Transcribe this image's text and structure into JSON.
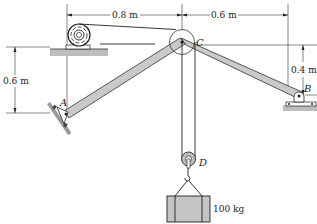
{
  "diagram": {
    "dimensions": {
      "top_left": "0.8 m",
      "top_right": "0.6 m",
      "left_vertical": "0.6 m",
      "right_vertical": "0.4 m"
    },
    "points": {
      "A": "A",
      "B": "B",
      "C": "C",
      "D": "D"
    },
    "mass_label": "100 kg",
    "colors": {
      "member_fill": "#c9c9c9",
      "ground_fill": "#bdbdbd",
      "crate_fill": "#c4c4c4",
      "line": "#222222"
    }
  }
}
